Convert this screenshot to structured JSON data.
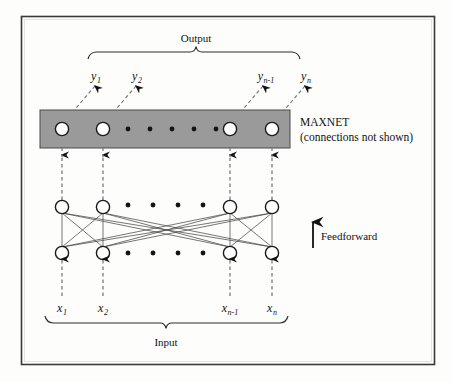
{
  "figure": {
    "title_top": "Output",
    "title_bottom": "Input",
    "maxnet_label_line1": "MAXNET",
    "maxnet_label_line2": "(connections not shown)",
    "feedforward_label": "Feedforward",
    "caption": "",
    "colors": {
      "frame": "#3a3a3a",
      "maxnet_band": "#9a9a9a",
      "maxnet_band_border": "#4a4a4a",
      "node_fill": "#ffffff",
      "node_stroke": "#1a1a1a",
      "dashed_line": "#707070",
      "solid_line": "#444444",
      "arrow": "#111111",
      "text": "#111111",
      "background": "#fdfdfc"
    },
    "output_labels": [
      {
        "base": "y",
        "sub": "1"
      },
      {
        "base": "y",
        "sub": "2"
      },
      {
        "base": "y",
        "sub": "n-1"
      },
      {
        "base": "y",
        "sub": "n"
      }
    ],
    "input_labels": [
      {
        "base": "x",
        "sub": "1"
      },
      {
        "base": "x",
        "sub": "2"
      },
      {
        "base": "x",
        "sub": "n-1"
      },
      {
        "base": "x",
        "sub": "n"
      }
    ],
    "layers": [
      {
        "name": "maxnet-layer",
        "node_count_visible": 4,
        "ellipsis_dots": 5
      },
      {
        "name": "upper-hidden-layer",
        "node_count_visible": 4,
        "ellipsis_dots": 5
      },
      {
        "name": "lower-input-layer",
        "node_count_visible": 4,
        "ellipsis_dots": 5
      }
    ],
    "node_columns_x": [
      62,
      103,
      230,
      272
    ],
    "layer_rows_y": {
      "maxnet": 129,
      "upper": 207,
      "lower": 253
    },
    "ellipsis_dots_x": [
      128,
      153,
      178,
      203,
      228
    ],
    "maxnet_dots_x": [
      128,
      150,
      172,
      194,
      216
    ],
    "band": {
      "x": 40,
      "y": 110,
      "width": 250,
      "height": 38
    },
    "frame": {
      "x": 21,
      "y": 16,
      "width": 414,
      "height": 349
    },
    "output_bracket": {
      "x1": 88,
      "x2": 300,
      "y": 52,
      "peak_x": 196
    },
    "input_bracket": {
      "x1": 45,
      "x2": 288,
      "y": 321,
      "peak_x": 166
    }
  }
}
